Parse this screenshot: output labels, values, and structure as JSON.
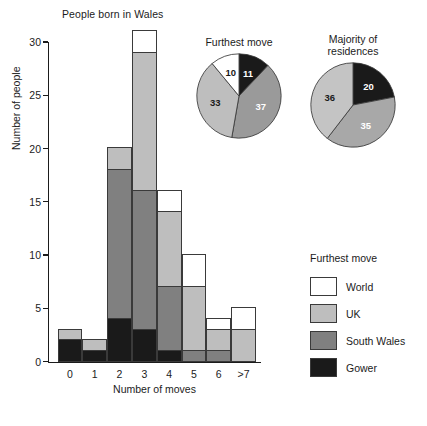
{
  "chart_data": {
    "type": "bar",
    "title": "People born in Wales",
    "xlabel": "Number of moves",
    "ylabel": "Number of people",
    "ylim": [
      0,
      30
    ],
    "yticks": [
      0,
      5,
      10,
      15,
      20,
      25,
      30
    ],
    "grid": false,
    "stacked": true,
    "categories": [
      "0",
      "1",
      "2",
      "3",
      "4",
      "5",
      "6",
      ">7"
    ],
    "series": [
      {
        "name": "Gower",
        "color": "#1a1a1a",
        "values": [
          2,
          1,
          4,
          3,
          1,
          0,
          0,
          0
        ]
      },
      {
        "name": "South Wales",
        "color": "#808080",
        "values": [
          0,
          0,
          14,
          13,
          6,
          1,
          1,
          0
        ]
      },
      {
        "name": "UK",
        "color": "#bebebe",
        "values": [
          1,
          1,
          2,
          13,
          7,
          6,
          2,
          3
        ]
      },
      {
        "name": "World",
        "color": "#ffffff",
        "values": [
          0,
          0,
          0,
          2,
          2,
          3,
          1,
          2
        ]
      }
    ],
    "totals": [
      3,
      2,
      20,
      31,
      16,
      10,
      4,
      5
    ],
    "legend": {
      "title": "Furthest move",
      "position": "right",
      "entries": [
        {
          "label": "World",
          "color": "#ffffff"
        },
        {
          "label": "UK",
          "color": "#bebebe"
        },
        {
          "label": "South Wales",
          "color": "#808080"
        },
        {
          "label": "Gower",
          "color": "#1a1a1a"
        }
      ]
    },
    "pies": [
      {
        "title": "Furthest move",
        "title_lines": [
          "Furthest move"
        ],
        "type": "pie",
        "slices": [
          {
            "label": "11",
            "value": 11,
            "color": "#1a1a1a",
            "label_color": "#ffffff"
          },
          {
            "label": "37",
            "value": 37,
            "color": "#9a9a9a",
            "label_color": "#ffffff"
          },
          {
            "label": "33",
            "value": 33,
            "color": "#bebebe",
            "label_color": "#1a1a1a"
          },
          {
            "label": "10",
            "value": 10,
            "color": "#ffffff",
            "label_color": "#1a1a1a"
          }
        ]
      },
      {
        "title": "Majority of residences",
        "title_lines": [
          "Majority of",
          "residences"
        ],
        "type": "pie",
        "slices": [
          {
            "label": "20",
            "value": 20,
            "color": "#1a1a1a",
            "label_color": "#ffffff"
          },
          {
            "label": "35",
            "value": 35,
            "color": "#a8a8a8",
            "label_color": "#ffffff"
          },
          {
            "label": "36",
            "value": 36,
            "color": "#c4c4c4",
            "label_color": "#1a1a1a"
          }
        ]
      }
    ]
  },
  "axis": {
    "y_title": "Number of people",
    "x_title": "Number of moves",
    "ytick_labels": [
      "0",
      "5",
      "10",
      "15",
      "20",
      "25",
      "30"
    ],
    "xtick_labels": [
      "0",
      "1",
      "2",
      "3",
      "4",
      "5",
      "6",
      ">7"
    ]
  }
}
